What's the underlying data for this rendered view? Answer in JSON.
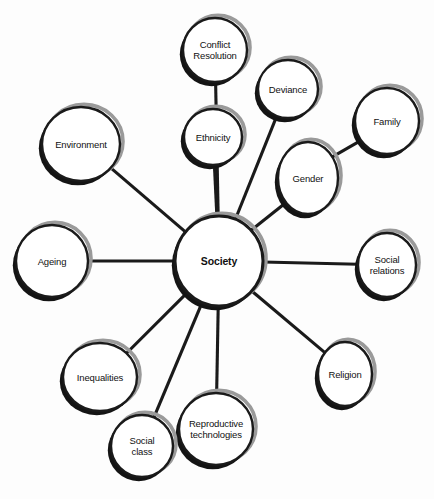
{
  "diagram": {
    "type": "mind-map",
    "title": "Society",
    "background_color": "#ffffff",
    "stroke_color": "#1a1a1a",
    "shadow_dark_color": "#141414",
    "shadow_light_color": "#9a9a9a",
    "fill_color": "#ffffff",
    "center": {
      "id": "society",
      "label": "Society",
      "cx": 219,
      "cy": 261,
      "rx": 44,
      "ry": 45,
      "bold": true
    },
    "nodes": [
      {
        "id": "conflict-resolution",
        "label": "Conflict\nResolution",
        "cx": 215,
        "cy": 50,
        "rx": 32,
        "ry": 32
      },
      {
        "id": "deviance",
        "label": "Deviance",
        "cx": 288,
        "cy": 89,
        "rx": 30,
        "ry": 29
      },
      {
        "id": "family",
        "label": "Family",
        "cx": 387,
        "cy": 121,
        "rx": 32,
        "ry": 33
      },
      {
        "id": "ethnicity",
        "label": "Ethnicity",
        "cx": 213,
        "cy": 137,
        "rx": 29,
        "ry": 28
      },
      {
        "id": "environment",
        "label": "Environment",
        "cx": 81,
        "cy": 144,
        "rx": 39,
        "ry": 37
      },
      {
        "id": "gender",
        "label": "Gender",
        "cx": 308,
        "cy": 178,
        "rx": 30,
        "ry": 36
      },
      {
        "id": "ageing",
        "label": "Ageing",
        "cx": 52,
        "cy": 261,
        "rx": 36,
        "ry": 36
      },
      {
        "id": "social-relations",
        "label": "Social\nrelations",
        "cx": 387,
        "cy": 265,
        "rx": 29,
        "ry": 32
      },
      {
        "id": "inequalities",
        "label": "Inequalities",
        "cx": 100,
        "cy": 377,
        "rx": 37,
        "ry": 34
      },
      {
        "id": "religion",
        "label": "Religion",
        "cx": 345,
        "cy": 374,
        "rx": 27,
        "ry": 32
      },
      {
        "id": "reproductive-technologies",
        "label": "Reproductive\ntechnologies",
        "cx": 216,
        "cy": 429,
        "rx": 37,
        "ry": 36
      },
      {
        "id": "social-class",
        "label": "Social\nclass",
        "cx": 142,
        "cy": 446,
        "rx": 31,
        "ry": 31
      }
    ],
    "edges": [
      {
        "from": "society",
        "to": "conflict-resolution",
        "via": "ethnicity"
      },
      {
        "from": "society",
        "to": "ethnicity"
      },
      {
        "from": "society",
        "to": "deviance"
      },
      {
        "from": "society",
        "to": "gender"
      },
      {
        "from": "gender",
        "to": "family"
      },
      {
        "from": "society",
        "to": "environment"
      },
      {
        "from": "society",
        "to": "ageing"
      },
      {
        "from": "society",
        "to": "social-relations"
      },
      {
        "from": "society",
        "to": "inequalities"
      },
      {
        "from": "society",
        "to": "social-class"
      },
      {
        "from": "society",
        "to": "reproductive-technologies"
      },
      {
        "from": "society",
        "to": "religion"
      }
    ]
  }
}
